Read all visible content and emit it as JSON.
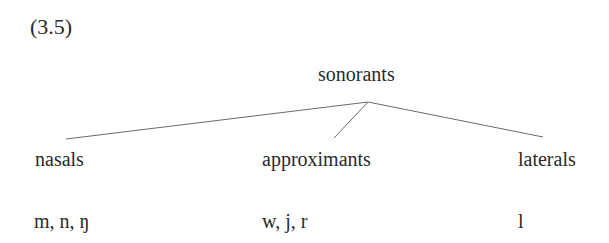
{
  "example_number": "(3.5)",
  "tree": {
    "root": "sonorants",
    "children": [
      {
        "label": "nasals",
        "members": "m, n, ŋ"
      },
      {
        "label": "approximants",
        "members": "w, j, r"
      },
      {
        "label": "laterals",
        "members": "l"
      }
    ]
  }
}
